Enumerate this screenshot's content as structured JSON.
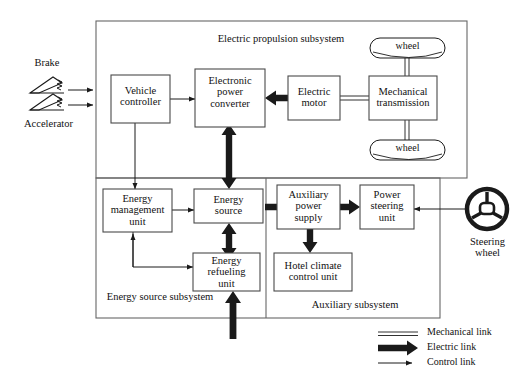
{
  "diagram": {
    "subsystems": [
      {
        "id": "propulsion",
        "label": "Electric propulsion subsystem"
      },
      {
        "id": "energy",
        "label": "Energy source subsystem"
      },
      {
        "id": "auxiliary",
        "label": "Auxiliary subsystem"
      }
    ],
    "blocks": [
      {
        "id": "vehicle-controller",
        "label": "Vehicle controller",
        "lines": [
          "Vehicle",
          "controller"
        ]
      },
      {
        "id": "electronic-power-converter",
        "label": "Electronic power converter",
        "lines": [
          "Electronic",
          "power",
          "converter"
        ]
      },
      {
        "id": "electric-motor",
        "label": "Electric motor",
        "lines": [
          "Electric",
          "motor"
        ]
      },
      {
        "id": "mechanical-transmission",
        "label": "Mechanical transmission",
        "lines": [
          "Mechanical",
          "transmission"
        ]
      },
      {
        "id": "energy-management-unit",
        "label": "Energy management unit",
        "lines": [
          "Energy",
          "management",
          "unit"
        ]
      },
      {
        "id": "energy-source",
        "label": "Energy source",
        "lines": [
          "Energy",
          "source"
        ]
      },
      {
        "id": "energy-refueling-unit",
        "label": "Energy refueling unit",
        "lines": [
          "Energy",
          "refueling",
          "unit"
        ]
      },
      {
        "id": "auxiliary-power-supply",
        "label": "Auxiliary power supply",
        "lines": [
          "Auxiliary",
          "power",
          "supply"
        ]
      },
      {
        "id": "power-steering-unit",
        "label": "Power steering unit",
        "lines": [
          "Power",
          "steering",
          "unit"
        ]
      },
      {
        "id": "hotel-climate-control-unit",
        "label": "Hotel climate control unit",
        "lines": [
          "Hotel climate",
          "control unit"
        ]
      }
    ],
    "wheels": [
      {
        "id": "wheel-top",
        "label": "wheel"
      },
      {
        "id": "wheel-bottom",
        "label": "wheel"
      }
    ],
    "inputs": [
      {
        "id": "brake",
        "label": "Brake",
        "icon": "brake-pedal-icon"
      },
      {
        "id": "accelerator",
        "label": "Accelerator",
        "icon": "accelerator-pedal-icon"
      }
    ],
    "steering": {
      "label_line1": "Steering",
      "label_line2": "wheel",
      "icon": "steering-wheel-icon"
    },
    "legend": {
      "items": [
        {
          "id": "mechanical-link",
          "label": "Mechanical link",
          "style": "double-line"
        },
        {
          "id": "electric-link",
          "label": "Electric link",
          "style": "thick-arrow"
        },
        {
          "id": "control-link",
          "label": "Control link",
          "style": "thin-arrow"
        }
      ]
    },
    "colors": {
      "line": "#1a1a1a",
      "frame": "#555555",
      "box_border": "#4a4a4a",
      "background": "#ffffff"
    }
  }
}
